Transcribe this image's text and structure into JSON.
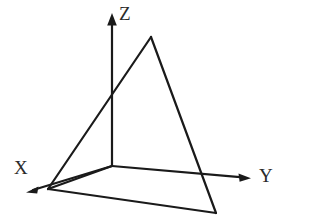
{
  "figure": {
    "width": 309,
    "height": 224,
    "background_color": "#ffffff",
    "stroke_color": "#1a1a1a",
    "label_color": "#2b2b2b"
  },
  "axes": {
    "origin": {
      "x": 112,
      "y": 166
    },
    "items": [
      {
        "name": "x-axis",
        "label": "X",
        "label_position": {
          "x": 14,
          "y": 158
        },
        "from": {
          "x": 112,
          "y": 166
        },
        "to": {
          "x": 29,
          "y": 191
        },
        "arrowhead": true
      },
      {
        "name": "y-axis",
        "label": "Y",
        "label_position": {
          "x": 259,
          "y": 166
        },
        "from": {
          "x": 112,
          "y": 166
        },
        "to": {
          "x": 249,
          "y": 178
        },
        "arrowhead": true
      },
      {
        "name": "z-axis",
        "label": "Z",
        "label_position": {
          "x": 119,
          "y": 4
        },
        "from": {
          "x": 112,
          "y": 166
        },
        "to": {
          "x": 112,
          "y": 15
        },
        "arrowhead": true
      }
    ]
  },
  "shapes": {
    "triangle": {
      "name": "triangular-plane",
      "points": "151,37 48,189 216,213",
      "fill": "none",
      "stroke_width": 2
    },
    "base_edges": {
      "name": "base-quadrilateral",
      "origin_to_left": "112,166 48,189",
      "left_to_right": "48,189 216,213",
      "stroke_width": 2
    }
  }
}
